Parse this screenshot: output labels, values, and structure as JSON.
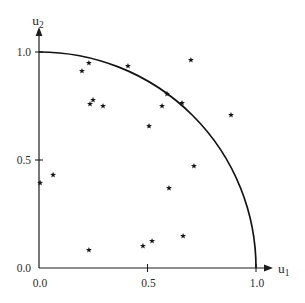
{
  "figure": {
    "background": "#ffffff"
  },
  "chart_data": {
    "type": "scatter",
    "title": "",
    "xlabel": {
      "base": "u",
      "sub": "1"
    },
    "ylabel": {
      "base": "u",
      "sub": "2"
    },
    "xlim": [
      0,
      1.08
    ],
    "ylim": [
      0,
      1.1
    ],
    "grid": false,
    "legend": false,
    "marker": "star",
    "x_ticks": [
      {
        "value": 0.0,
        "label": "0.0"
      },
      {
        "value": 0.5,
        "label": "0.5"
      },
      {
        "value": 1.0,
        "label": "1.0"
      }
    ],
    "y_ticks": [
      {
        "value": 0.0,
        "label": "0.0"
      },
      {
        "value": 0.5,
        "label": "0.5"
      },
      {
        "value": 1.0,
        "label": "1.0"
      }
    ],
    "curve": {
      "shape": "quarter-circle-arc",
      "center": [
        0,
        0
      ],
      "radius": 1.0
    },
    "points": [
      [
        0.198,
        0.912
      ],
      [
        0.23,
        0.949
      ],
      [
        0.41,
        0.935
      ],
      [
        0.7,
        0.963
      ],
      [
        0.249,
        0.778
      ],
      [
        0.235,
        0.759
      ],
      [
        0.295,
        0.75
      ],
      [
        0.59,
        0.806
      ],
      [
        0.659,
        0.764
      ],
      [
        0.567,
        0.75
      ],
      [
        0.885,
        0.708
      ],
      [
        0.507,
        0.657
      ],
      [
        0.065,
        0.431
      ],
      [
        0.005,
        0.394
      ],
      [
        0.714,
        0.472
      ],
      [
        0.599,
        0.37
      ],
      [
        0.664,
        0.148
      ],
      [
        0.521,
        0.125
      ],
      [
        0.479,
        0.102
      ],
      [
        0.23,
        0.083
      ]
    ],
    "colors": {
      "axis": "#1c1c1c",
      "curve": "#121212",
      "marker": "#141414",
      "text": "#2b2b2b",
      "background": "#ffffff"
    }
  }
}
